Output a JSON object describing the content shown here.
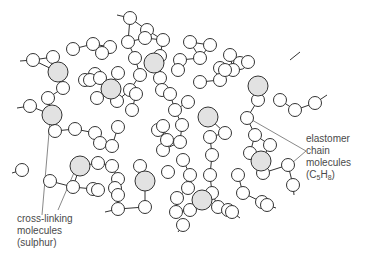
{
  "diagram": {
    "colors": {
      "line": "#333333",
      "small_fill": "#ffffff",
      "large_fill": "#e2e2e2",
      "text": "#4a4a4a"
    },
    "labels": {
      "elastomer": [
        "elastomer",
        "chain",
        "molecules",
        "(C5H8)"
      ],
      "crosslink": [
        "cross-linking",
        "molecules",
        "(sulphur)"
      ]
    },
    "sulphur_atoms": [
      [
        58,
        72
      ],
      [
        111,
        89
      ],
      [
        154,
        63
      ],
      [
        52,
        115
      ],
      [
        258,
        86
      ],
      [
        208,
        117
      ],
      [
        80,
        166
      ],
      [
        145,
        181
      ],
      [
        261,
        161
      ],
      [
        202,
        200
      ]
    ],
    "monomer_units": [
      [
        130,
        18
      ],
      [
        147,
        30
      ],
      [
        163,
        40
      ],
      [
        190,
        42
      ],
      [
        210,
        45
      ],
      [
        230,
        55
      ],
      [
        240,
        63
      ],
      [
        248,
        62
      ],
      [
        33,
        60
      ],
      [
        53,
        57
      ],
      [
        73,
        49
      ],
      [
        93,
        44
      ],
      [
        110,
        47
      ],
      [
        128,
        42
      ],
      [
        145,
        38
      ],
      [
        102,
        53
      ],
      [
        135,
        58
      ],
      [
        140,
        75
      ],
      [
        160,
        56
      ],
      [
        180,
        60
      ],
      [
        200,
        58
      ],
      [
        220,
        68
      ],
      [
        233,
        70
      ],
      [
        63,
        88
      ],
      [
        48,
        98
      ],
      [
        30,
        106
      ],
      [
        95,
        74
      ],
      [
        85,
        80
      ],
      [
        90,
        80
      ],
      [
        100,
        78
      ],
      [
        118,
        73
      ],
      [
        130,
        90
      ],
      [
        136,
        94
      ],
      [
        117,
        101
      ],
      [
        97,
        98
      ],
      [
        132,
        110
      ],
      [
        55,
        131
      ],
      [
        75,
        129
      ],
      [
        95,
        133
      ],
      [
        100,
        143
      ],
      [
        112,
        146
      ],
      [
        118,
        127
      ],
      [
        98,
        163
      ],
      [
        112,
        166
      ],
      [
        118,
        179
      ],
      [
        93,
        189
      ],
      [
        115,
        188
      ],
      [
        140,
        166
      ],
      [
        160,
        78
      ],
      [
        162,
        90
      ],
      [
        170,
        94
      ],
      [
        175,
        110
      ],
      [
        188,
        102
      ],
      [
        182,
        125
      ],
      [
        200,
        82
      ],
      [
        220,
        80
      ],
      [
        225,
        70
      ],
      [
        178,
        70
      ],
      [
        258,
        100
      ],
      [
        280,
        100
      ],
      [
        295,
        110
      ],
      [
        315,
        103
      ],
      [
        247,
        118
      ],
      [
        255,
        135
      ],
      [
        270,
        145
      ],
      [
        288,
        165
      ],
      [
        293,
        185
      ],
      [
        225,
        133
      ],
      [
        250,
        153
      ],
      [
        238,
        175
      ],
      [
        243,
        193
      ],
      [
        262,
        202
      ],
      [
        263,
        173
      ],
      [
        158,
        130
      ],
      [
        163,
        126
      ],
      [
        163,
        150
      ],
      [
        167,
        140
      ],
      [
        180,
        142
      ],
      [
        183,
        160
      ],
      [
        190,
        175
      ],
      [
        188,
        188
      ],
      [
        177,
        198
      ],
      [
        168,
        172
      ],
      [
        210,
        137
      ],
      [
        212,
        155
      ],
      [
        210,
        175
      ],
      [
        212,
        193
      ],
      [
        218,
        207
      ],
      [
        228,
        210
      ],
      [
        22,
        170
      ],
      [
        50,
        181
      ],
      [
        73,
        187
      ],
      [
        98,
        190
      ],
      [
        118,
        195
      ],
      [
        190,
        210
      ],
      [
        176,
        212
      ],
      [
        145,
        207
      ],
      [
        118,
        209
      ],
      [
        183,
        225
      ],
      [
        232,
        212
      ],
      [
        267,
        205
      ]
    ],
    "callouts": {
      "elastomer": {
        "text_x": 306,
        "text_y": 142,
        "lines": [
          [
            306,
            151,
            252,
            120
          ],
          [
            306,
            151,
            285,
            169
          ]
        ]
      },
      "crosslink": {
        "text_x": 17,
        "text_y": 218,
        "lines": [
          [
            42,
            215,
            50,
            121
          ],
          [
            58,
            210,
            76,
            168
          ]
        ]
      }
    }
  }
}
